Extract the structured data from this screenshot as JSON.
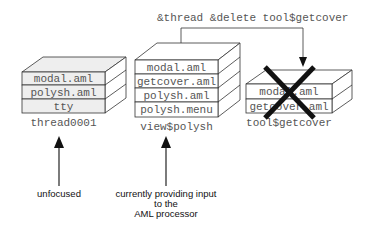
{
  "command": {
    "text": "&thread &delete tool$getcover"
  },
  "stacks": [
    {
      "name": "thread0001",
      "label": "thread0001",
      "fill": "#eeeeee",
      "layers": [
        "modal.aml",
        "polysh.aml",
        "tty"
      ]
    },
    {
      "name": "view$polysh",
      "label": "view$polysh",
      "fill": "#ffffff",
      "layers": [
        "modal.aml",
        "getcover.aml",
        "polysh.aml",
        "polysh.menu"
      ]
    },
    {
      "name": "tool$getcover",
      "label": "tool$getcover",
      "fill": "#ffffff",
      "deleted": true,
      "layers": [
        "modal.aml",
        "getcover.aml"
      ]
    }
  ],
  "annotations": {
    "unfocused": "unfocused",
    "current_line1": "currently providing input",
    "current_line2": "to the",
    "current_line3": "AML processor"
  }
}
